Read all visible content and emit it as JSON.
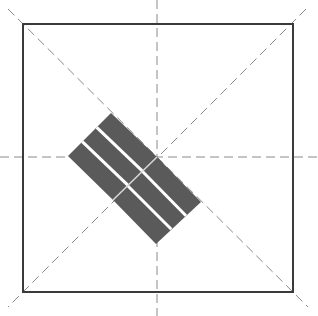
{
  "diagram": {
    "colors": {
      "background": "#ffffff",
      "frame": "#3a3a3a",
      "guides": "#8a8a8a",
      "bars": "#5a5a5a",
      "separators": "#ffffff"
    },
    "frame": {
      "x": 23,
      "y": 24,
      "width": 270,
      "height": 268
    },
    "center": {
      "x": 157,
      "y": 157
    },
    "guides": [
      {
        "name": "diagonal-main",
        "x1": 8,
        "y1": 9,
        "x2": 308,
        "y2": 307
      },
      {
        "name": "diagonal-anti",
        "x1": 306,
        "y1": 9,
        "x2": 8,
        "y2": 307
      },
      {
        "name": "vertical-center",
        "x1": 157,
        "y1": 0,
        "x2": 157,
        "y2": 316
      },
      {
        "name": "horizontal-center",
        "x1": 0,
        "y1": 157,
        "x2": 318,
        "y2": 157
      }
    ],
    "bar_groups": [
      {
        "name": "upper-left-group",
        "bar_count": 3,
        "corners": [
          [
            111,
            113
          ],
          [
            157,
            157
          ],
          [
            113,
            200
          ],
          [
            68,
            156
          ]
        ]
      },
      {
        "name": "lower-right-group",
        "bar_count": 3,
        "corners": [
          [
            113,
            200
          ],
          [
            157,
            157
          ],
          [
            201,
            202
          ],
          [
            156,
            244
          ]
        ]
      }
    ]
  }
}
